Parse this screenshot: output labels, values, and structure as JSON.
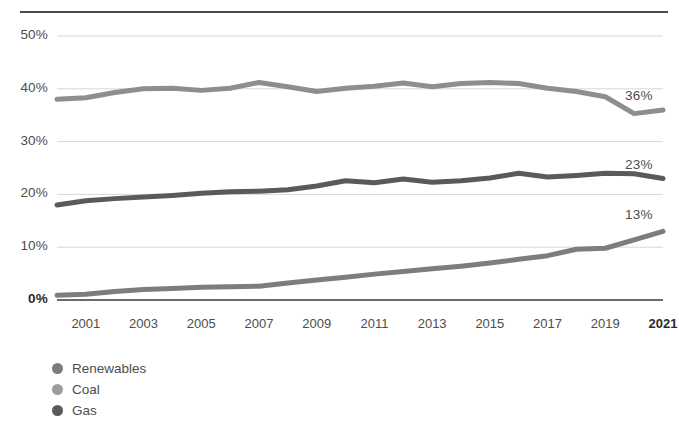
{
  "chart_data": {
    "type": "line",
    "title": "",
    "subtitle": "",
    "xlabel": "",
    "ylabel": "",
    "xlim": [
      2000,
      2021
    ],
    "ylim": [
      0,
      50
    ],
    "grid": true,
    "legend_position": "bottom-left",
    "x": [
      2000,
      2001,
      2002,
      2003,
      2004,
      2005,
      2006,
      2007,
      2008,
      2009,
      2010,
      2011,
      2012,
      2013,
      2014,
      2015,
      2016,
      2017,
      2018,
      2019,
      2020,
      2021
    ],
    "x_tick_labels": [
      "2001",
      "2003",
      "2005",
      "2007",
      "2009",
      "2011",
      "2013",
      "2015",
      "2017",
      "2019",
      "2021"
    ],
    "x_tick_values": [
      2001,
      2003,
      2005,
      2007,
      2009,
      2011,
      2013,
      2015,
      2017,
      2019,
      2021
    ],
    "y_tick_labels": [
      "50%",
      "40%",
      "30%",
      "20%",
      "10%",
      "0%"
    ],
    "y_tick_values": [
      50,
      40,
      30,
      20,
      10,
      0
    ],
    "series": [
      {
        "name": "Coal",
        "color": "#8e8e8e",
        "end_label": "36%",
        "values": [
          38.0,
          38.3,
          39.3,
          40.0,
          40.1,
          39.7,
          40.1,
          41.2,
          40.4,
          39.5,
          40.1,
          40.5,
          41.1,
          40.4,
          41.0,
          41.2,
          41.0,
          40.1,
          39.5,
          38.5,
          35.3,
          36.0
        ]
      },
      {
        "name": "Gas",
        "color": "#5a5a5a",
        "end_label": "23%",
        "values": [
          18.0,
          18.8,
          19.2,
          19.5,
          19.8,
          20.2,
          20.5,
          20.6,
          20.9,
          21.6,
          22.6,
          22.2,
          22.9,
          22.3,
          22.6,
          23.1,
          24.0,
          23.3,
          23.6,
          24.0,
          23.9,
          23.0
        ]
      },
      {
        "name": "Renewables",
        "color": "#7d7d7d",
        "end_label": "13%",
        "values": [
          0.9,
          1.1,
          1.6,
          2.0,
          2.2,
          2.4,
          2.5,
          2.6,
          3.2,
          3.8,
          4.3,
          4.9,
          5.4,
          5.9,
          6.4,
          7.0,
          7.7,
          8.4,
          9.6,
          9.8,
          11.4,
          13.0
        ]
      }
    ]
  },
  "legend": {
    "items": [
      {
        "label": "Renewables",
        "color": "#7d7d7d"
      },
      {
        "label": "Coal",
        "color": "#9d9d9d"
      },
      {
        "label": "Gas",
        "color": "#5a5a5a"
      }
    ]
  }
}
